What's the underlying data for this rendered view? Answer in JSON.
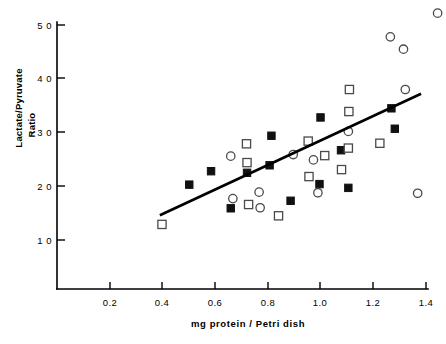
{
  "chart_data": {
    "type": "scatter",
    "title": "",
    "xlabel": "mg  protein  /  Petri  dish",
    "ylabel_line1": "Lactate/Pyruvate",
    "ylabel_line2": "Ratio",
    "xlim": [
      0.0,
      1.45
    ],
    "ylim": [
      0,
      53
    ],
    "grid": false,
    "legend": "none",
    "xticks": [
      0.2,
      0.4,
      0.6,
      0.8,
      1.0,
      1.2,
      1.4
    ],
    "xtick_labels": [
      "0.2",
      "0.4",
      "0.6",
      "0.8",
      "1.0",
      "1.2",
      "1.4"
    ],
    "yticks": [
      10,
      20,
      30,
      40,
      50
    ],
    "ytick_labels": [
      "1 0",
      "2 0",
      "3 0",
      "4 0",
      "5 0"
    ],
    "series": [
      {
        "name": "filled-square",
        "marker": "filled-square",
        "color": "#111111",
        "points": [
          [
            0.502,
            20.3
          ],
          [
            0.585,
            22.8
          ],
          [
            0.66,
            15.9
          ],
          [
            0.722,
            22.5
          ],
          [
            0.808,
            23.9
          ],
          [
            0.815,
            29.4
          ],
          [
            0.888,
            17.3
          ],
          [
            0.998,
            20.4
          ],
          [
            1.002,
            32.8
          ],
          [
            1.08,
            26.7
          ],
          [
            1.108,
            19.7
          ],
          [
            1.272,
            34.5
          ],
          [
            1.285,
            30.7
          ]
        ]
      },
      {
        "name": "open-square",
        "marker": "open-square",
        "color": "#4a4a4a",
        "points": [
          [
            0.398,
            12.9
          ],
          [
            0.72,
            27.9
          ],
          [
            0.722,
            24.4
          ],
          [
            0.728,
            16.6
          ],
          [
            0.842,
            14.5
          ],
          [
            0.955,
            28.4
          ],
          [
            0.958,
            21.8
          ],
          [
            1.018,
            25.7
          ],
          [
            1.082,
            23.1
          ],
          [
            1.108,
            27.1
          ],
          [
            1.11,
            33.9
          ],
          [
            1.112,
            38.0
          ],
          [
            1.228,
            28.0
          ]
        ]
      },
      {
        "name": "open-circle",
        "marker": "open-circle",
        "color": "#4a4a4a",
        "points": [
          [
            0.66,
            25.6
          ],
          [
            0.668,
            17.7
          ],
          [
            0.768,
            18.9
          ],
          [
            0.772,
            16.0
          ],
          [
            0.898,
            25.9
          ],
          [
            0.975,
            24.9
          ],
          [
            0.992,
            18.8
          ],
          [
            1.108,
            30.2
          ],
          [
            1.268,
            47.8
          ],
          [
            1.318,
            45.5
          ],
          [
            1.325,
            38.0
          ],
          [
            1.372,
            18.7
          ],
          [
            1.448,
            52.2
          ]
        ]
      }
    ],
    "fit_line": {
      "name": "regression-line",
      "x_start": 0.39,
      "y_start": 14.6,
      "x_end": 1.385,
      "y_end": 37.2
    }
  },
  "axes": {
    "x_axis_name": "x-axis",
    "y_axis_name": "y-axis"
  }
}
